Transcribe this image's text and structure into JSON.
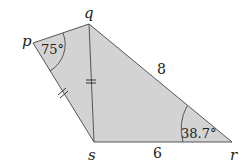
{
  "diagram": {
    "type": "quadrilateral",
    "fill_color": "#d3d3d3",
    "stroke_color": "#555555",
    "vertices": {
      "p": {
        "label": "p",
        "x": 33,
        "y": 43
      },
      "q": {
        "label": "q",
        "x": 89,
        "y": 24
      },
      "r": {
        "label": "r",
        "x": 232,
        "y": 142
      },
      "s": {
        "label": "s",
        "x": 94,
        "y": 142
      }
    },
    "diagonal": {
      "from": "q",
      "to": "s",
      "tick_marks": 2
    },
    "edges": [
      {
        "from": "p",
        "to": "q"
      },
      {
        "from": "q",
        "to": "r",
        "length_label": "8"
      },
      {
        "from": "r",
        "to": "s",
        "length_label": "6"
      },
      {
        "from": "s",
        "to": "p",
        "tick_marks": 2
      }
    ],
    "angles": [
      {
        "vertex": "p",
        "label": "75°"
      },
      {
        "vertex": "r",
        "label": "38.7°"
      }
    ]
  }
}
